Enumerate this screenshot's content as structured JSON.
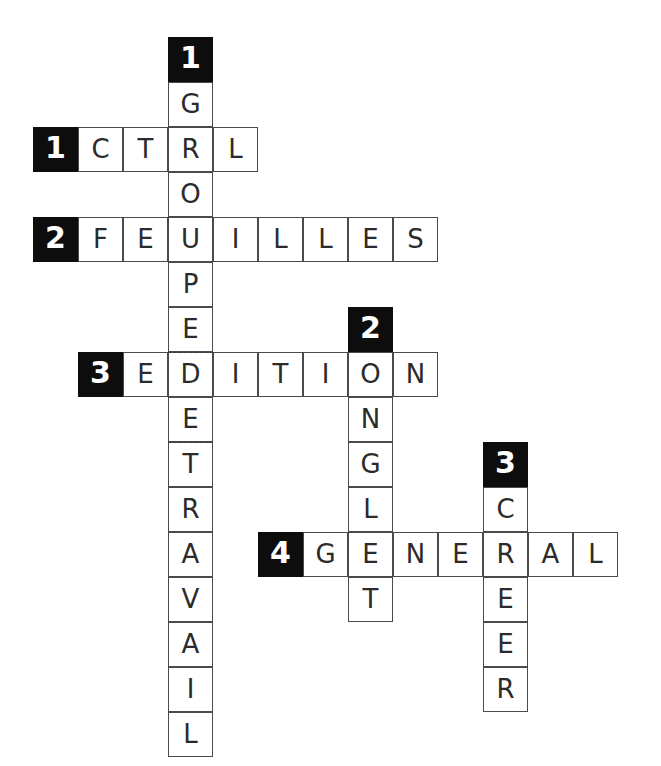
{
  "puzzle": {
    "title": "Mots croises",
    "grid": {
      "origin_x": 33,
      "origin_y": 37,
      "cell_size": 45,
      "columns": 13,
      "rows": 16
    },
    "colors": {
      "clue_number_background": "#0d0d0d",
      "clue_number_text": "#ffffff",
      "cell_background": "#ffffff",
      "cell_border": "#4a4a4a",
      "letter_text": "#2b2b2b"
    },
    "entries": [
      {
        "number": "1",
        "direction": "down",
        "answer": "GROUPEDETRAVAIL",
        "display": "GROUPE DE TRAVAIL",
        "number_col": 3,
        "number_row": 0,
        "start_col": 3,
        "start_row": 1,
        "letters": [
          "G",
          "R",
          "O",
          "U",
          "P",
          "E",
          "D",
          "E",
          "T",
          "R",
          "A",
          "V",
          "A",
          "I",
          "L"
        ],
        "word_breaks_after": [
          5,
          7
        ]
      },
      {
        "number": "1",
        "direction": "across",
        "answer": "CTRL",
        "display": "CTRL",
        "number_col": 0,
        "number_row": 2,
        "start_col": 1,
        "start_row": 2,
        "letters": [
          "C",
          "T",
          "R",
          "L"
        ]
      },
      {
        "number": "2",
        "direction": "across",
        "answer": "FEUILLES",
        "display": "FEUILLES",
        "number_col": 0,
        "number_row": 4,
        "start_col": 1,
        "start_row": 4,
        "letters": [
          "F",
          "E",
          "U",
          "I",
          "L",
          "L",
          "E",
          "S"
        ]
      },
      {
        "number": "3",
        "direction": "across",
        "answer": "EDITION",
        "display": "EDITION",
        "number_col": 1,
        "number_row": 7,
        "start_col": 2,
        "start_row": 7,
        "letters": [
          "E",
          "D",
          "I",
          "T",
          "I",
          "O",
          "N"
        ]
      },
      {
        "number": "2",
        "direction": "down",
        "answer": "ONGLET",
        "display": "ONGLET",
        "number_col": 7,
        "number_row": 6,
        "start_col": 7,
        "start_row": 7,
        "letters": [
          "O",
          "N",
          "G",
          "L",
          "E",
          "T"
        ]
      },
      {
        "number": "3",
        "direction": "down",
        "answer": "CREER",
        "display": "CREER",
        "number_col": 10,
        "number_row": 9,
        "start_col": 10,
        "start_row": 10,
        "letters": [
          "C",
          "R",
          "E",
          "E",
          "R"
        ]
      },
      {
        "number": "4",
        "direction": "across",
        "answer": "GENERAL",
        "display": "GENERAL",
        "number_col": 5,
        "number_row": 11,
        "start_col": 6,
        "start_row": 11,
        "letters": [
          "G",
          "E",
          "N",
          "E",
          "R",
          "A",
          "L"
        ]
      }
    ]
  }
}
